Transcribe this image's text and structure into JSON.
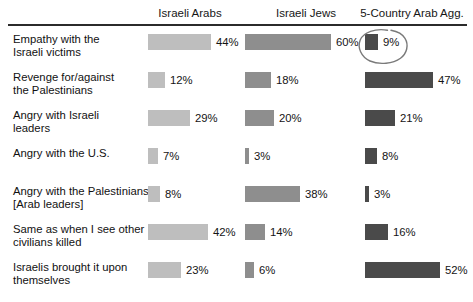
{
  "chart_data": {
    "type": "bar",
    "title": "",
    "subtitle": "",
    "xlabel": "",
    "ylabel": "",
    "orientation": "horizontal",
    "grid": false,
    "legend_position": "top-as-column-headers",
    "value_suffix": "%",
    "axis_range": [
      0,
      60
    ],
    "categories": [
      "Empathy with the Israeli victims",
      "Revenge for/against the Palestinians",
      "Angry with Israeli leaders",
      "Angry with the U.S.",
      "Angry with the Palestinians [Arab leaders]",
      "Same as when I see other civilians killed",
      "Israelis brought it upon themselves"
    ],
    "series": [
      {
        "name": "Israeli Arabs",
        "color": "#bebebe",
        "values": [
          44,
          12,
          29,
          7,
          8,
          42,
          23
        ]
      },
      {
        "name": "Israeli Jews",
        "color": "#8e8e8e",
        "values": [
          60,
          18,
          20,
          3,
          38,
          14,
          6
        ]
      },
      {
        "name": "5-Country Arab Agg.",
        "color": "#4a4a4a",
        "values": [
          9,
          47,
          21,
          8,
          3,
          16,
          52
        ]
      }
    ],
    "annotations": [
      {
        "type": "hand-drawn-ellipse",
        "target_series": "5-Country Arab Agg.",
        "target_category": "Empathy with the Israeli victims",
        "target_value": 9,
        "color": "#7a7a7a"
      }
    ]
  },
  "header": {
    "columns": [
      {
        "label": "Israeli Arabs",
        "center_x": 190
      },
      {
        "label": "Israeli Jews",
        "center_x": 306
      },
      {
        "label": "5-Country Arab Agg.",
        "center_x": 412
      }
    ]
  },
  "rows": [
    {
      "label_line1": "Empathy with the",
      "label_line2": "Israeli victims",
      "cells": [
        {
          "value": 44,
          "label": "44%"
        },
        {
          "value": 60,
          "label": "60%"
        },
        {
          "value": 9,
          "label": "9%"
        }
      ]
    },
    {
      "label_line1": "Revenge for/against",
      "label_line2": "the Palestinians",
      "cells": [
        {
          "value": 12,
          "label": "12%"
        },
        {
          "value": 18,
          "label": "18%"
        },
        {
          "value": 47,
          "label": "47%"
        }
      ]
    },
    {
      "label_line1": "Angry with Israeli",
      "label_line2": "leaders",
      "cells": [
        {
          "value": 29,
          "label": "29%"
        },
        {
          "value": 20,
          "label": "20%"
        },
        {
          "value": 21,
          "label": "21%"
        }
      ]
    },
    {
      "label_line1": "Angry with the U.S.",
      "label_line2": "",
      "cells": [
        {
          "value": 7,
          "label": "7%"
        },
        {
          "value": 3,
          "label": "3%"
        },
        {
          "value": 8,
          "label": "8%"
        }
      ]
    },
    {
      "label_line1": "Angry with the Palestinians",
      "label_line2": "[Arab leaders]",
      "cells": [
        {
          "value": 8,
          "label": "8%"
        },
        {
          "value": 38,
          "label": "38%"
        },
        {
          "value": 3,
          "label": "3%"
        }
      ]
    },
    {
      "label_line1": "Same as when I see other",
      "label_line2": "civilians killed",
      "cells": [
        {
          "value": 42,
          "label": "42%"
        },
        {
          "value": 14,
          "label": "14%"
        },
        {
          "value": 16,
          "label": "16%"
        }
      ]
    },
    {
      "label_line1": "Israelis brought it upon",
      "label_line2": "themselves",
      "cells": [
        {
          "value": 23,
          "label": "23%"
        },
        {
          "value": 6,
          "label": "6%"
        },
        {
          "value": 52,
          "label": "52%"
        }
      ]
    }
  ],
  "layout": {
    "column_bar_start_x": [
      148,
      245,
      365
    ],
    "px_per_percent": 1.44,
    "row_top_start": 33,
    "row_pitch": 38,
    "bar_height": 16
  },
  "colors": {
    "series1": "#bebebe",
    "series2": "#8e8e8e",
    "series3": "#4a4a4a",
    "rule": "#2b2b2b",
    "text": "#141414",
    "annotation": "#7a7a7a"
  }
}
